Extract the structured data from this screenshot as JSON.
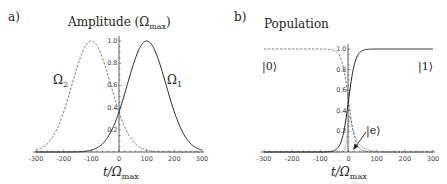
{
  "panels": [
    {
      "letter": "a)",
      "title": "Amplitude (Ω",
      "title_sub": "max",
      "title_close": ")",
      "xlabel": "t/Ω",
      "xlabel_sub": "max",
      "curve_labels": [
        {
          "text": "Ω",
          "sub": "2"
        },
        {
          "text": "Ω",
          "sub": "1"
        }
      ],
      "xticks": [
        "-300",
        "-200",
        "-100",
        "0",
        "100",
        "200",
        "300"
      ],
      "yticks": [
        "0.2",
        "0.4",
        "0.6",
        "0.8",
        "1.0"
      ]
    },
    {
      "letter": "b)",
      "title": "Population",
      "xlabel": "t/Ω",
      "xlabel_sub": "max",
      "state_labels": [
        "|0⟩",
        "|1⟩",
        "|e⟩"
      ],
      "xticks": [
        "-300",
        "-200",
        "-100",
        "0",
        "100",
        "200",
        "300"
      ],
      "yticks": [
        "0.2",
        "0.4",
        "0.6",
        "0.8",
        "1.0"
      ]
    }
  ],
  "chart_data": [
    {
      "type": "line",
      "title": "Amplitude (Ωmax)",
      "xlabel": "t/Ωmax",
      "ylabel": "",
      "xlim": [
        -300,
        300
      ],
      "ylim": [
        0,
        1.0
      ],
      "grid": false,
      "series": [
        {
          "name": "Ω1",
          "style": "solid",
          "shape": "gaussian",
          "center": 100,
          "width_sigma": 70,
          "peak": 1.0
        },
        {
          "name": "Ω2",
          "style": "dashed",
          "shape": "gaussian",
          "center": -100,
          "width_sigma": 70,
          "peak": 1.0
        }
      ],
      "annotations": [
        "Ω2 (left, dashed)",
        "Ω1 (right, solid)"
      ]
    },
    {
      "type": "line",
      "title": "Population",
      "xlabel": "t/Ωmax",
      "ylabel": "",
      "xlim": [
        -300,
        300
      ],
      "ylim": [
        0,
        1.0
      ],
      "grid": false,
      "series": [
        {
          "name": "|0⟩",
          "style": "dashed",
          "shape": "falling-sigmoid",
          "center": 0,
          "width": 12,
          "start": 1.0,
          "end": 0.0
        },
        {
          "name": "|1⟩",
          "style": "solid",
          "shape": "rising-sigmoid",
          "center": 0,
          "width": 12,
          "start": 0.0,
          "end": 1.0
        },
        {
          "name": "|e⟩",
          "style": "dotted",
          "shape": "peak",
          "center": 5,
          "peak": 0.35
        }
      ],
      "annotations": [
        "|0⟩",
        "|1⟩",
        "|e⟩ (arrow)"
      ]
    }
  ]
}
